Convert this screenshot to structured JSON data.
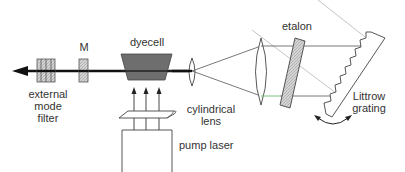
{
  "diagram": {
    "labels": {
      "mirror": "M",
      "dyecell": "dyecell",
      "etalon": "etalon",
      "filter_line1": "external",
      "filter_line2": "mode",
      "filter_line3": "filter",
      "cyl_line1": "cylindrical",
      "cyl_line2": "lens",
      "pump": "pump laser",
      "grating_line1": "Littrow",
      "grating_line2": "grating"
    },
    "components": [
      "external mode filter",
      "M (output mirror)",
      "dyecell",
      "focusing lens",
      "collimating lens",
      "etalon",
      "Littrow grating",
      "cylindrical lens",
      "pump laser"
    ],
    "colors": {
      "line": "#333333",
      "beam": "#111111",
      "dyecell_fill": "#6e6e6e",
      "hatch_fill": "#c8c8c8",
      "guide_line": "#b5b5b5",
      "green_ray": "#6fb86f"
    }
  }
}
